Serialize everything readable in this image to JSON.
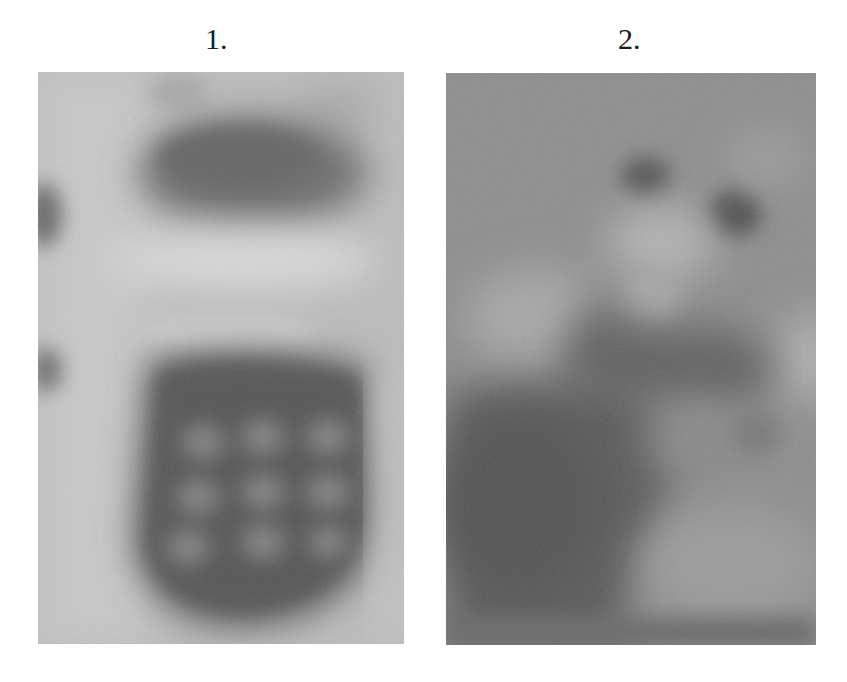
{
  "figure": {
    "panels": [
      {
        "label": "1.",
        "description": "Blurred grayscale photograph, light background with dark blob at top, bright horizontal band at middle, and dark rounded object with a 3x3 grid of lighter spots (resembling a keypad) in lower half",
        "tone": "light",
        "base_color": "#bdbdbd"
      },
      {
        "label": "2.",
        "description": "Blurred grayscale photograph, mid-gray background with two small dark spots near top, a light oval region, a dark curved band across the middle and darker lower-left region",
        "tone": "mid-gray",
        "base_color": "#8f8f8f"
      }
    ]
  }
}
